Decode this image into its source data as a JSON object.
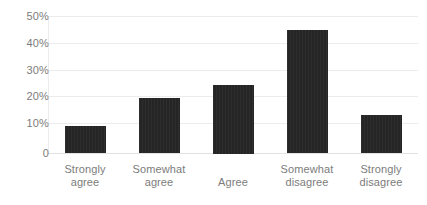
{
  "chart_data": {
    "type": "bar",
    "title": "",
    "subtitle": "",
    "xlabel": "",
    "ylabel": "",
    "categories": [
      "Strongly agree",
      "Somewhat agree",
      "Agree",
      "Somewhat disagree",
      "Strongly disagree"
    ],
    "category_lines": [
      [
        "Strongly",
        "agree"
      ],
      [
        "Somewhat",
        "agree"
      ],
      [
        "Agree"
      ],
      [
        "Somewhat",
        "disagree"
      ],
      [
        "Strongly",
        "disagree"
      ]
    ],
    "values": [
      10,
      20,
      25,
      45,
      14
    ],
    "value_labels": [
      "10%",
      "20%",
      "25%",
      "45%",
      "14%"
    ],
    "ylim": [
      0,
      50
    ],
    "ytick_values": [
      50,
      40,
      30,
      20,
      10,
      0
    ],
    "ytick_labels": [
      "50%",
      "40%",
      "30%",
      "20%",
      "10%",
      "0"
    ],
    "grid": true,
    "legend": false,
    "legend_position": "none",
    "bar_color": "#252525",
    "gridline_color": "#ececec",
    "axis_label_color": "#7c7c7c",
    "background_color": "#ffffff"
  }
}
